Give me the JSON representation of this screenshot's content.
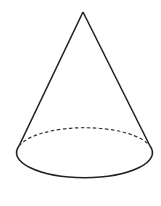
{
  "diagram": {
    "shape": "cone",
    "stroke_color": "#222222",
    "background": "#ffffff",
    "apex": [
      83,
      12
    ],
    "base": {
      "cx": 84.5,
      "cy": 153,
      "rx": 68,
      "ry": 25
    },
    "hidden_edge_style": "dashed"
  }
}
